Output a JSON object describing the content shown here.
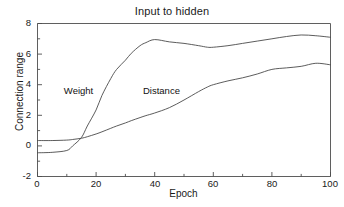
{
  "chart_data": {
    "type": "line",
    "title": "Input to hidden",
    "xlabel": "Epoch",
    "ylabel": "Connection range",
    "xlim": [
      0,
      100
    ],
    "ylim": [
      -2,
      8
    ],
    "xticks": [
      "0",
      "20",
      "40",
      "60",
      "80",
      "100"
    ],
    "yticks": [
      "8",
      "6",
      "4",
      "2",
      "0",
      "-2"
    ],
    "grid": false,
    "legend_position": "inline-annotations",
    "annotations": [
      {
        "text": "Weight",
        "x": 9,
        "y": 3.6
      },
      {
        "text": "Distance",
        "x": 36,
        "y": 3.6
      }
    ],
    "x": [
      0,
      5,
      10,
      12,
      15,
      17,
      20,
      22,
      25,
      27,
      30,
      32,
      35,
      37,
      40,
      45,
      50,
      55,
      58,
      60,
      65,
      70,
      75,
      80,
      85,
      90,
      95,
      100
    ],
    "series": [
      {
        "name": "Weight",
        "values": [
          -0.45,
          -0.42,
          -0.3,
          0.0,
          0.55,
          1.3,
          2.35,
          3.3,
          4.4,
          5.0,
          5.6,
          6.05,
          6.55,
          6.75,
          6.95,
          6.8,
          6.7,
          6.55,
          6.45,
          6.45,
          6.55,
          6.7,
          6.85,
          7.0,
          7.15,
          7.25,
          7.2,
          7.1
        ]
      },
      {
        "name": "Distance",
        "values": [
          0.35,
          0.35,
          0.38,
          0.42,
          0.5,
          0.6,
          0.78,
          0.92,
          1.15,
          1.3,
          1.5,
          1.65,
          1.85,
          1.98,
          2.15,
          2.5,
          3.0,
          3.55,
          3.85,
          4.0,
          4.25,
          4.45,
          4.7,
          5.0,
          5.1,
          5.2,
          5.4,
          5.3
        ]
      }
    ],
    "colors": {
      "axis": "#4d4d4d",
      "weight_line": "#4a4a4a",
      "distance_line": "#4a4a4a",
      "background": "#ffffff"
    }
  },
  "axis_ticks": {
    "x": [
      {
        "label": "0",
        "left": 22
      },
      {
        "label": "20",
        "left": 81
      },
      {
        "label": "40",
        "left": 140
      },
      {
        "label": "60",
        "left": 198
      },
      {
        "label": "80",
        "left": 257
      },
      {
        "label": "100",
        "left": 315
      }
    ],
    "y": [
      {
        "label": "8",
        "top": 17
      },
      {
        "label": "6",
        "top": 48
      },
      {
        "label": "4",
        "top": 78
      },
      {
        "label": "2",
        "top": 109
      },
      {
        "label": "0",
        "top": 139
      },
      {
        "label": "-2",
        "top": 170
      }
    ]
  }
}
